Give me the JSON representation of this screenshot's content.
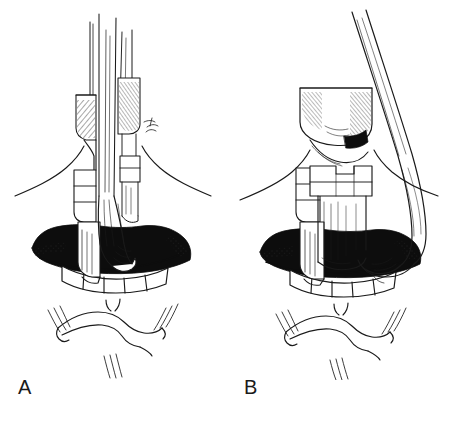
{
  "figure": {
    "background_color": "#ffffff",
    "ink_color": "#1a1a1a",
    "width": 452,
    "height": 422,
    "style": "pen-and-ink medical illustration"
  },
  "panels": [
    {
      "id": "A",
      "label": "A",
      "caption_position": "bottom-left",
      "description": "Frontal view of open mouth with rigid instrument shafts directed straight vertically through the oral aperture; upper teeth, tongue base and chin visible.",
      "elements": {
        "instrument_primary": "rigid scope shaft (vertical)",
        "instrument_secondary": "blade / retractor shaft (vertical)",
        "anatomy_upper_lip": "upper lip",
        "anatomy_teeth": "upper incisors",
        "anatomy_oral_cavity": "shaded oral cavity",
        "anatomy_lower_lip": "lower lip",
        "anatomy_chin": "chin"
      }
    },
    {
      "id": "B",
      "label": "B",
      "caption_position": "bottom-left",
      "description": "Frontal view of open mouth with the instrument shaft angled laterally to the patient's left while the blade remains in the midline; upper teeth, tongue base and chin visible.",
      "elements": {
        "instrument_primary": "rigid scope shaft (angled laterally)",
        "instrument_secondary": "blade / retractor shaft (midline)",
        "anatomy_upper_lip": "upper lip",
        "anatomy_teeth": "upper incisors",
        "anatomy_oral_cavity": "shaded oral cavity",
        "anatomy_lower_lip": "lower lip",
        "anatomy_chin": "chin"
      }
    }
  ]
}
